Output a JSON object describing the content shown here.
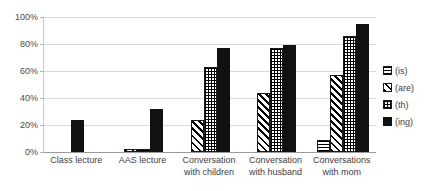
{
  "chart_data": {
    "type": "bar",
    "title": "",
    "subtitle": "",
    "xlabel": "",
    "ylabel": "",
    "ylim": [
      0,
      100
    ],
    "yticks": [
      "0%",
      "20%",
      "40%",
      "60%",
      "80%",
      "100%"
    ],
    "ytick_values": [
      0,
      20,
      40,
      60,
      80,
      100
    ],
    "grid": true,
    "legend_position": "right",
    "categories": [
      "Class lecture",
      "AAS lecture",
      "Conversation with children",
      "Conversation with husband",
      "Conversations with mom"
    ],
    "series": [
      {
        "name": "(is)",
        "pattern": "horizontal-lines",
        "values": [
          0,
          0,
          0,
          0,
          9
        ]
      },
      {
        "name": "(are)",
        "pattern": "diagonal-stripes",
        "values": [
          0,
          2,
          24,
          44,
          57
        ]
      },
      {
        "name": "(th)",
        "pattern": "crosshatch",
        "values": [
          0,
          2,
          63,
          77,
          86
        ]
      },
      {
        "name": "(ing)",
        "pattern": "solid-black",
        "values": [
          24,
          32,
          77,
          79,
          95
        ]
      }
    ]
  },
  "legend": {
    "items": [
      {
        "label": "(is)",
        "swatch": "horizontal-lines-swatch"
      },
      {
        "label": "(are)",
        "swatch": "diagonal-stripes-swatch"
      },
      {
        "label": "(th)",
        "swatch": "crosshatch-swatch"
      },
      {
        "label": "(ing)",
        "swatch": "solid-black-swatch"
      }
    ]
  }
}
